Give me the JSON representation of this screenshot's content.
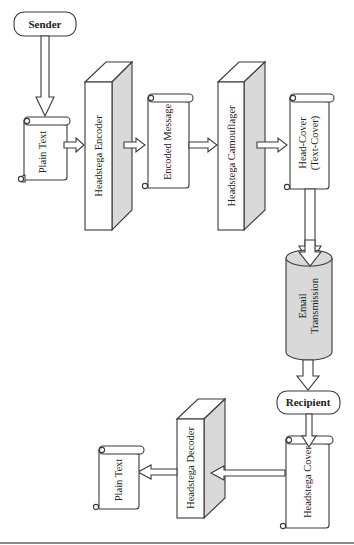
{
  "diagram": {
    "nodes": {
      "sender": {
        "label": "Sender",
        "shape": "rounded-rect"
      },
      "plain_text_in": {
        "label": "Plain Text",
        "shape": "scroll"
      },
      "encoder": {
        "label": "Headstega Encoder",
        "shape": "3d-block"
      },
      "encoded_message": {
        "label": "Encoded Message",
        "shape": "scroll"
      },
      "camouflager": {
        "label": "Headstega Camouflager",
        "shape": "3d-block"
      },
      "head_cover": {
        "label_line1": "Head-Cover",
        "label_line2": "(Text-Cover)",
        "shape": "scroll"
      },
      "email": {
        "label_line1": "Email",
        "label_line2": "Transmission",
        "shape": "cylinder"
      },
      "recipient": {
        "label": "Recipient",
        "shape": "rounded-rect"
      },
      "headstega_cover": {
        "label": "Headstega Cover",
        "shape": "scroll"
      },
      "decoder": {
        "label": "Headstega Decoder",
        "shape": "3d-block"
      },
      "plain_text_out": {
        "label": "Plain Text",
        "shape": "scroll"
      }
    },
    "edges": [
      [
        "Sender",
        "Plain Text"
      ],
      [
        "Plain Text",
        "Headstega Encoder"
      ],
      [
        "Headstega Encoder",
        "Encoded Message"
      ],
      [
        "Encoded Message",
        "Headstega Camouflager"
      ],
      [
        "Headstega Camouflager",
        "Head-Cover (Text-Cover)"
      ],
      [
        "Head-Cover (Text-Cover)",
        "Email Transmission"
      ],
      [
        "Email Transmission",
        "Recipient"
      ],
      [
        "Recipient",
        "Headstega Cover"
      ],
      [
        "Headstega Cover",
        "Headstega Decoder"
      ],
      [
        "Headstega Decoder",
        "Plain Text"
      ]
    ],
    "colors": {
      "stroke": "#3a3a3a",
      "shade": "#d9d9d9",
      "background": "#ffffff"
    }
  }
}
